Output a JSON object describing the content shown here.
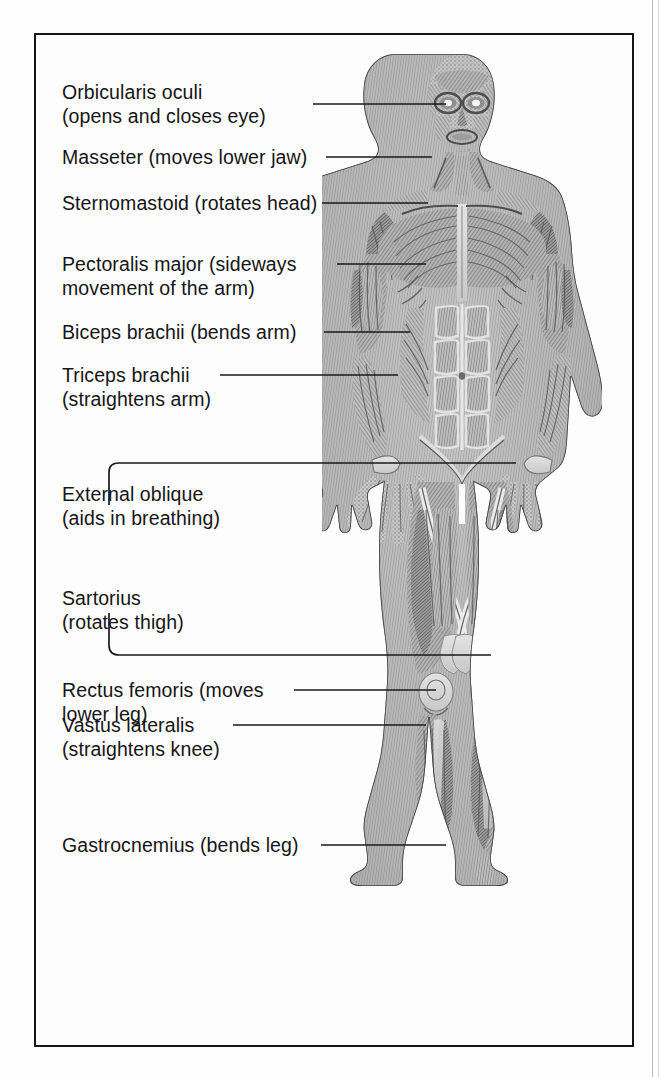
{
  "plate": {
    "title": "Muscles of the human body (anterior view)",
    "figure_alt": "Engraved anatomical illustration of a standing male figure with skin removed showing superficial skeletal muscles, front view",
    "border_color": "#161616",
    "background_color": "#fdfdfd",
    "ink_color": "#151515"
  },
  "labels": [
    {
      "id": "orbicularis-oculi",
      "name": "Orbicularis oculi",
      "function": "(opens and closes eye)",
      "lines": [
        "Orbicularis oculi",
        "(opens and closes eye)"
      ],
      "leader": "straight",
      "target": "eye"
    },
    {
      "id": "masseter",
      "name": "Masseter",
      "function": "(moves lower jaw)",
      "lines": [
        "Masseter (moves lower jaw)"
      ],
      "leader": "straight",
      "target": "jaw"
    },
    {
      "id": "sternomastoid",
      "name": "Sternomastoid",
      "function": "(rotates head)",
      "lines": [
        "Sternomastoid (rotates head)"
      ],
      "leader": "straight",
      "target": "neck"
    },
    {
      "id": "pectoralis-major",
      "name": "Pectoralis major",
      "function": "(sideways movement of the arm)",
      "lines": [
        "Pectoralis major (sideways",
        "movement of the arm)"
      ],
      "leader": "straight",
      "target": "chest"
    },
    {
      "id": "biceps-brachii",
      "name": "Biceps brachii",
      "function": "(bends arm)",
      "lines": [
        "Biceps brachii (bends arm)"
      ],
      "leader": "straight",
      "target": "upper-arm-front"
    },
    {
      "id": "triceps-brachii",
      "name": "Triceps brachii",
      "function": "(straightens arm)",
      "lines": [
        "Triceps brachii",
        "(straightens arm)"
      ],
      "leader": "straight",
      "target": "upper-arm-back"
    },
    {
      "id": "external-oblique",
      "name": "External oblique",
      "function": "(aids in breathing)",
      "lines": [
        "External oblique",
        "(aids in breathing)"
      ],
      "leader": "bracket-up",
      "target": "flank"
    },
    {
      "id": "sartorius",
      "name": "Sartorius",
      "function": "(rotates thigh)",
      "lines": [
        "Sartorius",
        "(rotates thigh)"
      ],
      "leader": "bracket-down",
      "target": "inner-thigh"
    },
    {
      "id": "rectus-femoris",
      "name": "Rectus femoris",
      "function": "(moves lower leg)",
      "lines": [
        "Rectus femoris (moves",
        "lower leg)"
      ],
      "leader": "straight",
      "target": "front-thigh"
    },
    {
      "id": "vastus-lateralis",
      "name": "Vastus lateralis",
      "function": "(straightens knee)",
      "lines": [
        "Vastus lateralis",
        "(straightens knee)"
      ],
      "leader": "straight",
      "target": "outer-thigh"
    },
    {
      "id": "gastrocnemius",
      "name": "Gastrocnemius",
      "function": "(bends leg)",
      "lines": [
        "Gastrocnemius (bends leg)"
      ],
      "leader": "straight",
      "target": "calf"
    }
  ]
}
